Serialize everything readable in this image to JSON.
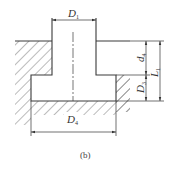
{
  "diagram": {
    "caption": "(b)",
    "labels": {
      "D1": {
        "main": "D",
        "sub": "1"
      },
      "D3": {
        "main": "D",
        "sub": "3"
      },
      "D4": {
        "main": "D",
        "sub": "4"
      },
      "d4": {
        "main": "d",
        "sub": "4"
      },
      "L1": {
        "main": "L",
        "sub": "1"
      }
    },
    "colors": {
      "line": "#3a3a3a",
      "hatch": "#555555",
      "background": "#ffffff"
    }
  }
}
